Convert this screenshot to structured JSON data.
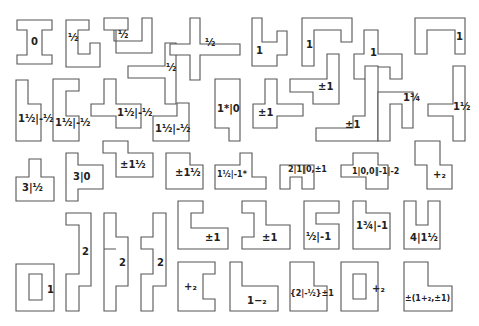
{
  "figure": {
    "stroke_color": "#555555",
    "background": "#ffffff",
    "tiles": [
      {
        "id": "r1c1",
        "label": "0",
        "points": "17,20 52,20 52,30 42,30 42,55 52,55 52,64 17,64 17,55 27,55 27,30 17,30",
        "lx": 31,
        "ly": 37
      },
      {
        "id": "r1c2",
        "label": "½",
        "points": "66,20 89,20 89,30 78,30 78,54 90,54 90,43 100,43 100,67 66,67",
        "lx": 68,
        "ly": 33
      },
      {
        "id": "r1c3",
        "label": "½",
        "points": "104,18 128,18 128,30 114,30 114,41 142,41 142,18 152,18 152,53 116,53 116,30 104,30",
        "lx": 118,
        "ly": 30
      },
      {
        "id": "r1c4",
        "label": "½",
        "points": "128,66 165,66 165,43 176,43 176,104 165,104 165,78 128,78",
        "lx": 166,
        "ly": 63
      },
      {
        "id": "r1c5",
        "label": "½",
        "points": "190,18 200,18 200,44 240,44 240,55 200,55 200,80 190,80 190,55 170,55 170,44 190,44",
        "lx": 205,
        "ly": 38
      },
      {
        "id": "r1c6",
        "label": "1",
        "points": "252,18 262,18 262,42 277,42 277,31 287,31 287,55 277,55 277,66 252,66",
        "lx": 256,
        "ly": 46
      },
      {
        "id": "r1c7",
        "label": "1",
        "points": "302,18 352,18 352,42 341,42 341,30 314,30 314,66 302,66",
        "lx": 306,
        "ly": 40
      },
      {
        "id": "r1c8",
        "label": "1",
        "points": "364,30 378,30 378,54 402,54 402,79 390,79 390,67 366,67 366,79 354,79 354,54 364,54",
        "lx": 370,
        "ly": 48
      },
      {
        "id": "r1c9",
        "label": "1",
        "points": "415,18 465,18 465,54 455,54 455,30 427,30 427,54 415,54",
        "lx": 456,
        "ly": 32
      },
      {
        "id": "r2c1",
        "label": "1½|-½",
        "points": "16,80 28,80 28,104 41,104 41,141 16,141",
        "lx": 18,
        "ly": 114
      },
      {
        "id": "r2c2",
        "label": "1½|-½",
        "points": "53,79 79,79 79,91 66,91 66,116 79,116 79,141 53,141",
        "lx": 55,
        "ly": 118
      },
      {
        "id": "r2c3",
        "label": "1½|-½",
        "points": "104,79 116,79 116,104 141,104 141,128 116,128 116,116 91,116 91,104 104,104",
        "lx": 117,
        "ly": 108
      },
      {
        "id": "r2c4",
        "label": "1½|-½",
        "points": "153,116 177,116 177,103 189,103 189,141 153,141",
        "lx": 155,
        "ly": 124
      },
      {
        "id": "r2c5",
        "label": "1*|0",
        "points": "215,79 240,79 240,141 229,141 229,128 215,128",
        "lx": 217,
        "ly": 104
      },
      {
        "id": "r2c6",
        "label": "±1",
        "points": "265,79 277,79 277,104 303,104 303,116 277,116 277,128 253,128 253,104 265,104",
        "lx": 258,
        "ly": 108
      },
      {
        "id": "r2c7",
        "label": "±1",
        "points": "327,54 339,54 339,104 313,104 313,92 290,92 290,79 327,79",
        "lx": 318,
        "ly": 82
      },
      {
        "id": "r2c8",
        "label": "±1",
        "points": "365,66 378,66 378,141 316,141 316,128 353,128 353,116 365,116",
        "lx": 345,
        "ly": 120
      },
      {
        "id": "r2c9",
        "label": "1¾",
        "points": "378,92 413,92 413,128 402,128 402,104 390,104 390,141 378,141",
        "lx": 403,
        "ly": 93
      },
      {
        "id": "r2c10",
        "label": "1½",
        "points": "453,66 465,66 465,141 453,141 453,116 428,116 428,104 453,104",
        "lx": 453,
        "ly": 102
      },
      {
        "id": "r3c1",
        "label": "3|½",
        "points": "29,159 41,159 41,177 54,177 54,201 16,201 16,177 29,177",
        "lx": 22,
        "ly": 183
      },
      {
        "id": "r3c2",
        "label": "3|0",
        "points": "66,153 78,153 78,165 103,165 103,189 78,189 78,201 66,201",
        "lx": 73,
        "ly": 172
      },
      {
        "id": "r3c3",
        "label": "±1½",
        "points": "103,141 128,141 128,153 153,153 153,177 116,177 116,153 103,153",
        "lx": 120,
        "ly": 160
      },
      {
        "id": "r3c4",
        "label": "±1½",
        "points": "166,153 190,153 190,165 203,165 203,189 166,189",
        "lx": 175,
        "ly": 168
      },
      {
        "id": "r3c5",
        "label": "1½|-1*",
        "points": "215,165 240,165 240,153 252,153 252,177 266,177 266,189 215,189",
        "lx": 217,
        "ly": 170
      },
      {
        "id": "r3c6",
        "label": "2|1‖0,±1",
        "points": "290,165 314,165 314,189 302,189 302,177 290,177 290,189 280,189 280,165",
        "lx": 288,
        "ly": 165
      },
      {
        "id": "r3c7",
        "label": "1|0,0‖-1|-2",
        "points": "353,153 378,153 378,165 388,165 388,189 366,189 366,177 341,177 341,165 353,165",
        "lx": 352,
        "ly": 167
      },
      {
        "id": "r3c8",
        "label": "+₂",
        "points": "415,141 440,141 440,165 452,165 452,189 427,189 427,165 415,165",
        "lx": 433,
        "ly": 170
      },
      {
        "id": "r4c1",
        "label": "2",
        "points": "66,213 91,213 91,286 79,286 79,311 66,311 66,274 79,274 79,225 66,225",
        "lx": 82,
        "ly": 247
      },
      {
        "id": "r4c2",
        "label": "2",
        "points": "104,213 116,213 116,237 128,237 128,286 116,286 116,311 104,311 104,249 116,249 116,249 104,249",
        "lx": 119,
        "ly": 258
      },
      {
        "id": "r4c3",
        "label": "2",
        "points": "153,213 166,213 166,286 153,286 153,311 141,311 141,274 153,274 153,249 141,249 141,237 153,237",
        "lx": 157,
        "ly": 258
      },
      {
        "id": "r4c4",
        "label": "1",
        "points": "16,264 54,264 54,311 16,311",
        "lx": 47,
        "ly": 285,
        "hole": "29,274 42,274 42,300 29,300"
      },
      {
        "id": "r5c1",
        "label": "±1",
        "points": "178,201 203,201 203,213 191,213 191,228 228,228 228,249 178,249",
        "lx": 205,
        "ly": 233
      },
      {
        "id": "r5c2",
        "label": "±1",
        "points": "242,201 266,201 266,225 290,225 290,249 242,249 242,237 254,237 254,213 242,213",
        "lx": 262,
        "ly": 233
      },
      {
        "id": "r5c3",
        "label": "½|-1",
        "points": "304,201 339,201 339,213 316,213 316,224 339,224 339,249 304,249",
        "lx": 306,
        "ly": 232
      },
      {
        "id": "r5c4",
        "label": "1¾|-1",
        "points": "353,201 366,201 366,213 390,213 390,249 353,249",
        "lx": 356,
        "ly": 221
      },
      {
        "id": "r5c5",
        "label": "4|1½",
        "points": "404,201 416,201 416,225 428,225 428,201 440,201 440,249 404,249",
        "lx": 410,
        "ly": 233
      },
      {
        "id": "r6c1",
        "label": "+₂",
        "points": "178,262 215,262 215,274 203,274 203,299 215,299 215,311 178,311",
        "lx": 184,
        "ly": 282
      },
      {
        "id": "r6c2",
        "label": "1−₂",
        "points": "230,262 242,262 242,286 278,286 278,311 230,311",
        "lx": 247,
        "ly": 296
      },
      {
        "id": "r6c3",
        "label": "{2|-½}±1",
        "points": "290,262 314,262 314,286 327,286 327,311 290,311",
        "lx": 290,
        "ly": 289
      },
      {
        "id": "r6c4",
        "label": "+₂",
        "points": "341,262 378,262 378,311 341,311",
        "lx": 372,
        "ly": 284,
        "hole": "353,274 366,274 366,299 353,299"
      },
      {
        "id": "r6c5",
        "label": "±(1+₂,±1)",
        "points": "404,262 428,262 428,286 452,286 452,311 404,311",
        "lx": 405,
        "ly": 294
      }
    ]
  }
}
